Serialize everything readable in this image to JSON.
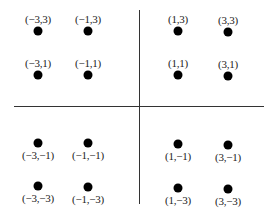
{
  "diagram": {
    "type": "constellation",
    "axes": {
      "vertical": {
        "x": 139,
        "y1": 10,
        "y2": 204
      },
      "horizontal": {
        "y": 106,
        "x1": 14,
        "x2": 264
      },
      "color": "#333333"
    },
    "dot_color": "#000000",
    "points": [
      {
        "label": "(−3,3)",
        "px": 38,
        "py": 31,
        "label_pos": "above"
      },
      {
        "label": "(−1,3)",
        "px": 88,
        "py": 31,
        "label_pos": "above"
      },
      {
        "label": "(1,3)",
        "px": 178,
        "py": 31,
        "label_pos": "above"
      },
      {
        "label": "(3,3)",
        "px": 228,
        "py": 32,
        "label_pos": "above"
      },
      {
        "label": "(−3,1)",
        "px": 38,
        "py": 75,
        "label_pos": "above"
      },
      {
        "label": "(−1,1)",
        "px": 88,
        "py": 75,
        "label_pos": "above"
      },
      {
        "label": "(1,1)",
        "px": 178,
        "py": 75,
        "label_pos": "above"
      },
      {
        "label": "(3,1)",
        "px": 228,
        "py": 76,
        "label_pos": "above"
      },
      {
        "label": "(−3,−1)",
        "px": 38,
        "py": 143,
        "label_pos": "below"
      },
      {
        "label": "(−1,−1)",
        "px": 88,
        "py": 143,
        "label_pos": "below"
      },
      {
        "label": "(1,−1)",
        "px": 178,
        "py": 144,
        "label_pos": "below"
      },
      {
        "label": "(3,−1)",
        "px": 228,
        "py": 145,
        "label_pos": "below"
      },
      {
        "label": "(−3,−3)",
        "px": 38,
        "py": 186,
        "label_pos": "below"
      },
      {
        "label": "(−1,−3)",
        "px": 88,
        "py": 187,
        "label_pos": "below"
      },
      {
        "label": "(1,−3)",
        "px": 178,
        "py": 188,
        "label_pos": "below"
      },
      {
        "label": "(3,−3)",
        "px": 228,
        "py": 189,
        "label_pos": "below"
      }
    ]
  }
}
